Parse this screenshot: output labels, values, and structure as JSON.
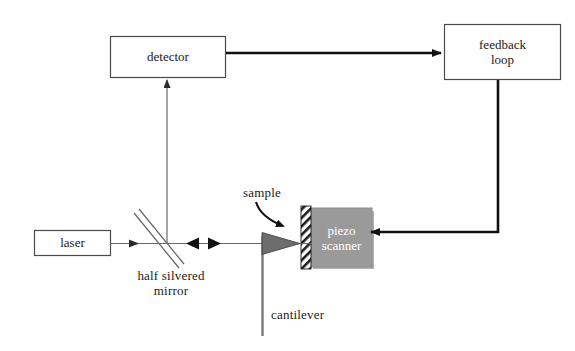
{
  "diagram": {
    "colors": {
      "stroke": "#3a3a3a",
      "thick_stroke": "#111111",
      "piezo_fill": "#9a9a9a",
      "piezo_text": "#ffffff",
      "background": "#ffffff",
      "text": "#1a1a1a"
    },
    "boxes": [
      {
        "id": "detector",
        "label": "detector"
      },
      {
        "id": "feedback",
        "label_line1": "feedback",
        "label_line2": "loop"
      },
      {
        "id": "laser",
        "label": "laser"
      },
      {
        "id": "piezo",
        "label_line1": "piezo",
        "label_line2": "scanner"
      }
    ],
    "labels": {
      "sample": "sample",
      "mirror_line1": "half silvered",
      "mirror_line2": "mirror",
      "cantilever": "cantilever"
    },
    "connections": [
      {
        "id": "detector-to-feedback",
        "from": "detector",
        "to": "feedback",
        "style": "thick-arrow-right"
      },
      {
        "id": "feedback-to-piezo",
        "from": "feedback",
        "to": "piezo",
        "style": "thick-elbow-arrow-left"
      },
      {
        "id": "mirror-to-detector",
        "from": "mirror",
        "to": "detector",
        "style": "thin-arrow-up"
      },
      {
        "id": "laser-to-mirror",
        "from": "laser",
        "to": "mirror",
        "style": "thin-arrow-right"
      },
      {
        "id": "mirror-to-cantilever",
        "from": "mirror",
        "to": "cantilever",
        "style": "thin-double-arrow"
      }
    ],
    "elements": [
      {
        "id": "half-silvered-mirror",
        "shape": "double-diagonal-line"
      },
      {
        "id": "cantilever",
        "shape": "vertical-line-with-triangular-tip"
      },
      {
        "id": "sample-strip",
        "shape": "hatched-vertical-strip"
      },
      {
        "id": "sample-pointer",
        "shape": "curved-arrow"
      }
    ]
  }
}
